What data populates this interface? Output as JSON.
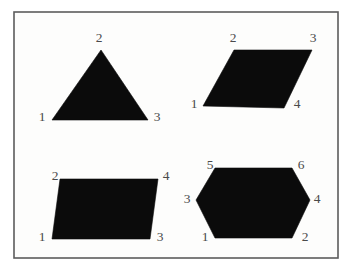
{
  "figure": {
    "background_color": "#ffffff",
    "panel_fill_color": "#fdfdfc",
    "frame_color": "#5c5c5c",
    "shape_fill_color": "#0b0b0b",
    "label_color": "#4a4a4a",
    "frame": {
      "x": 14,
      "y": 12,
      "width": 324,
      "height": 246
    },
    "shapes": [
      {
        "name": "triangle",
        "kind": "triangle",
        "vertex_count": 3,
        "points": "101,50 148,120 52,120",
        "labels": [
          {
            "text": "1",
            "x": 42,
            "y": 117
          },
          {
            "text": "2",
            "x": 99,
            "y": 38
          },
          {
            "text": "3",
            "x": 157,
            "y": 117
          }
        ]
      },
      {
        "name": "self-intersecting-quadrilateral",
        "kind": "bowtie",
        "vertex_count": 4,
        "points": "203,106 234,50 312,50 284,108",
        "labels": [
          {
            "text": "1",
            "x": 194,
            "y": 104
          },
          {
            "text": "2",
            "x": 233,
            "y": 38
          },
          {
            "text": "3",
            "x": 313,
            "y": 38
          },
          {
            "text": "4",
            "x": 297,
            "y": 104
          }
        ]
      },
      {
        "name": "parallelogram",
        "kind": "quadrilateral",
        "vertex_count": 4,
        "points": "52,239 60,179 158,179 150,239",
        "labels": [
          {
            "text": "1",
            "x": 42,
            "y": 237
          },
          {
            "text": "2",
            "x": 55,
            "y": 176
          },
          {
            "text": "3",
            "x": 160,
            "y": 237
          },
          {
            "text": "4",
            "x": 166,
            "y": 176
          }
        ]
      },
      {
        "name": "hexagon",
        "kind": "hexagon",
        "vertex_count": 6,
        "points": "215,238 292,238 310,200 292,168 215,168 196,200",
        "labels": [
          {
            "text": "1",
            "x": 205,
            "y": 237
          },
          {
            "text": "2",
            "x": 305,
            "y": 237
          },
          {
            "text": "3",
            "x": 187,
            "y": 199
          },
          {
            "text": "4",
            "x": 317,
            "y": 199
          },
          {
            "text": "5",
            "x": 210,
            "y": 165
          },
          {
            "text": "6",
            "x": 301,
            "y": 165
          }
        ]
      }
    ]
  }
}
